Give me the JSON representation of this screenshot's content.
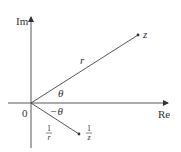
{
  "diagram": {
    "axes": {
      "imaginary_label": "Im",
      "real_label": "Re",
      "origin_label": "0"
    },
    "points": {
      "z": {
        "label": "z"
      },
      "inverse": {
        "label_num": "1",
        "label_den": "z"
      }
    },
    "segments": {
      "to_z": {
        "length_label": "r",
        "angle_label": "θ"
      },
      "to_inverse": {
        "length_num": "1",
        "length_den": "r",
        "angle_label": "−θ"
      }
    },
    "colors": {
      "line": "#444444",
      "text": "#333333"
    }
  }
}
